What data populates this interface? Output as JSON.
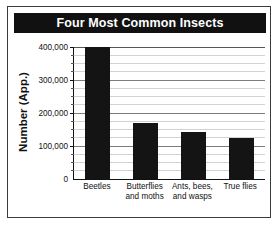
{
  "figure": {
    "title": "Four Most Common Insects",
    "title_bg": "#111111",
    "title_color": "#ffffff",
    "frame_color": "#3a3a3a",
    "background": "#ffffff"
  },
  "axis": {
    "ylabel": "Number (App.)",
    "ytick_labels": [
      "0",
      "100,000",
      "200,000",
      "300,000",
      "400,000"
    ],
    "ytick_values": [
      0,
      100000,
      200000,
      300000,
      400000
    ]
  },
  "chart_data": {
    "type": "bar",
    "title": "Four Most Common Insects",
    "subtitle": "",
    "xlabel": "",
    "ylabel": "Number (App.)",
    "categories": [
      "Beetles",
      "Butterflies and moths",
      "Ants, bees, and wasps",
      "True flies"
    ],
    "category_label_lines": [
      [
        "Beetles"
      ],
      [
        "Butterflies",
        "and moths"
      ],
      [
        "Ants, bees,",
        "and wasps"
      ],
      [
        "True flies"
      ]
    ],
    "values": [
      400000,
      170000,
      143000,
      123000
    ],
    "ylim": [
      0,
      400000
    ],
    "ytick_values": [
      0,
      100000,
      200000,
      300000,
      400000
    ],
    "ytick_labels": [
      "0",
      "100,000",
      "200,000",
      "300,000",
      "400,000"
    ],
    "minor_tick_step": 25000,
    "grid": true,
    "grid_axis": "y",
    "legend": false,
    "legend_position": "none",
    "bar_color": "#141414",
    "gridline_color": "#d2d2d2",
    "major_gridline_color": "#7d7d7d"
  }
}
